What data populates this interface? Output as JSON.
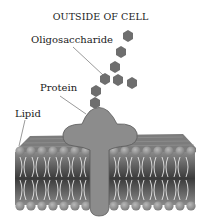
{
  "diagram": {
    "title": "OUTSIDE OF CELL",
    "labels": {
      "oligosaccharide": "Oligosaccharide",
      "protein": "Protein",
      "lipid": "Lipid"
    },
    "colors": {
      "sugar": "#6e6e6e",
      "protein": "#8c8c8c",
      "protein_outline": "#5a5a5a",
      "lipid_head": "#9a9a9a",
      "membrane_top": "#7a7a7a",
      "tails": "#e8e8e8"
    }
  }
}
